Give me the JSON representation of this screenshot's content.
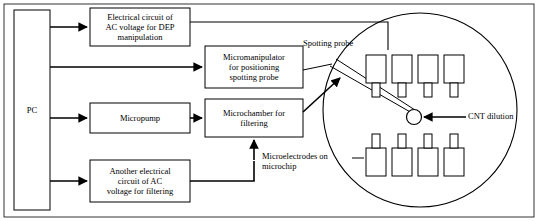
{
  "diagram": {
    "type": "block-flow-diagram",
    "boxes": [
      {
        "id": "pc",
        "label": "PC",
        "x": 14,
        "y": 10,
        "w": 36,
        "h": 200
      },
      {
        "id": "dep-circuit",
        "label": "Electrical circuit of\nAC voltage for DEP\nmanipulation",
        "x": 90,
        "y": 8,
        "w": 100,
        "h": 38
      },
      {
        "id": "micromanip",
        "label": "Micromanipulator\nfor positioning\nspotting probe",
        "x": 205,
        "y": 46,
        "w": 98,
        "h": 42
      },
      {
        "id": "micropump",
        "label": "Micropump",
        "x": 90,
        "y": 103,
        "w": 100,
        "h": 30
      },
      {
        "id": "microchamber",
        "label": "Microchamber for\nfiltering",
        "x": 205,
        "y": 99,
        "w": 98,
        "h": 38
      },
      {
        "id": "ac-filtering",
        "label": "Another electrical\ncircuit of AC\nvoltage for filtering",
        "x": 90,
        "y": 160,
        "w": 100,
        "h": 42
      }
    ],
    "annotations": [
      {
        "id": "spotting-probe",
        "label": "Spotting probe",
        "x": 303,
        "y": 38,
        "w": 80
      },
      {
        "id": "cnt-dilution",
        "label": "CNT dilution",
        "x": 468,
        "y": 104,
        "w": 64
      },
      {
        "id": "microelectrodes",
        "label": "Microelectrodes on\nmicrochip",
        "x": 262,
        "y": 151,
        "w": 90
      }
    ],
    "chip": {
      "id": "microchip-circle",
      "cx": 420,
      "cy": 110,
      "r": 100,
      "electrodes_top": 4,
      "electrodes_bottom": 4,
      "droplet": {
        "cx": 414,
        "cy": 117,
        "r": 7
      }
    }
  }
}
